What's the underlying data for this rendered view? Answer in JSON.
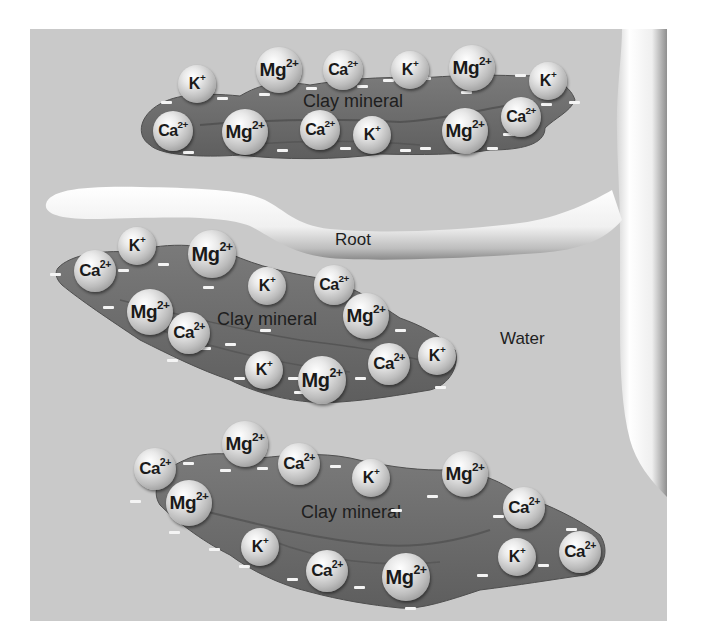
{
  "figure": {
    "labels": {
      "root": "Root",
      "water": "Water",
      "clay_mineral": "Clay mineral"
    },
    "colors": {
      "background": "#c9c9c9",
      "clay": "#6e6e6e",
      "clay_edge": "#4a4a4a",
      "root": "#f2f2f2",
      "negative_charge": "#f4f4f4"
    },
    "clusters": [
      {
        "label": "Clay mineral",
        "ions": [
          {
            "symbol": "K",
            "charge": "+",
            "x": 197,
            "y": 84,
            "r": 19
          },
          {
            "symbol": "Mg",
            "charge": "2+",
            "x": 279,
            "y": 70,
            "r": 23
          },
          {
            "symbol": "Ca",
            "charge": "2+",
            "x": 343,
            "y": 70,
            "r": 20
          },
          {
            "symbol": "K",
            "charge": "+",
            "x": 410,
            "y": 70,
            "r": 19
          },
          {
            "symbol": "Mg",
            "charge": "2+",
            "x": 472,
            "y": 68,
            "r": 23
          },
          {
            "symbol": "K",
            "charge": "+",
            "x": 548,
            "y": 81,
            "r": 19
          },
          {
            "symbol": "Ca",
            "charge": "2+",
            "x": 173,
            "y": 131,
            "r": 20
          },
          {
            "symbol": "Mg",
            "charge": "2+",
            "x": 245,
            "y": 132,
            "r": 23
          },
          {
            "symbol": "Ca",
            "charge": "2+",
            "x": 320,
            "y": 130,
            "r": 20
          },
          {
            "symbol": "K",
            "charge": "+",
            "x": 372,
            "y": 135,
            "r": 19
          },
          {
            "symbol": "Mg",
            "charge": "2+",
            "x": 465,
            "y": 131,
            "r": 23
          },
          {
            "symbol": "Ca",
            "charge": "2+",
            "x": 521,
            "y": 117,
            "r": 20
          }
        ]
      },
      {
        "label": "Clay mineral",
        "ions": [
          {
            "symbol": "K",
            "charge": "+",
            "x": 137,
            "y": 246,
            "r": 19
          },
          {
            "symbol": "Ca",
            "charge": "2+",
            "x": 95,
            "y": 271,
            "r": 21
          },
          {
            "symbol": "Mg",
            "charge": "2+",
            "x": 212,
            "y": 254,
            "r": 24
          },
          {
            "symbol": "K",
            "charge": "+",
            "x": 267,
            "y": 286,
            "r": 19
          },
          {
            "symbol": "Ca",
            "charge": "2+",
            "x": 334,
            "y": 285,
            "r": 20
          },
          {
            "symbol": "Mg",
            "charge": "2+",
            "x": 366,
            "y": 316,
            "r": 23
          },
          {
            "symbol": "Mg",
            "charge": "2+",
            "x": 150,
            "y": 312,
            "r": 23
          },
          {
            "symbol": "Ca",
            "charge": "2+",
            "x": 189,
            "y": 333,
            "r": 21
          },
          {
            "symbol": "K",
            "charge": "+",
            "x": 264,
            "y": 370,
            "r": 19
          },
          {
            "symbol": "Mg",
            "charge": "2+",
            "x": 322,
            "y": 380,
            "r": 24
          },
          {
            "symbol": "Ca",
            "charge": "2+",
            "x": 389,
            "y": 364,
            "r": 21
          },
          {
            "symbol": "K",
            "charge": "+",
            "x": 437,
            "y": 356,
            "r": 19
          }
        ]
      },
      {
        "label": "Clay mineral",
        "ions": [
          {
            "symbol": "Mg",
            "charge": "2+",
            "x": 245,
            "y": 444,
            "r": 23
          },
          {
            "symbol": "Ca",
            "charge": "2+",
            "x": 155,
            "y": 469,
            "r": 21
          },
          {
            "symbol": "Ca",
            "charge": "2+",
            "x": 299,
            "y": 464,
            "r": 21
          },
          {
            "symbol": "K",
            "charge": "+",
            "x": 371,
            "y": 478,
            "r": 19
          },
          {
            "symbol": "Mg",
            "charge": "2+",
            "x": 465,
            "y": 474,
            "r": 23
          },
          {
            "symbol": "Ca",
            "charge": "2+",
            "x": 524,
            "y": 508,
            "r": 21
          },
          {
            "symbol": "Mg",
            "charge": "2+",
            "x": 189,
            "y": 503,
            "r": 23
          },
          {
            "symbol": "K",
            "charge": "+",
            "x": 260,
            "y": 547,
            "r": 19
          },
          {
            "symbol": "Ca",
            "charge": "2+",
            "x": 327,
            "y": 571,
            "r": 21
          },
          {
            "symbol": "Mg",
            "charge": "2+",
            "x": 406,
            "y": 577,
            "r": 24
          },
          {
            "symbol": "K",
            "charge": "+",
            "x": 517,
            "y": 557,
            "r": 19
          },
          {
            "symbol": "Ca",
            "charge": "2+",
            "x": 580,
            "y": 552,
            "r": 21
          }
        ]
      }
    ],
    "negative_charges": [
      [
        166,
        102
      ],
      [
        222,
        98
      ],
      [
        264,
        94
      ],
      [
        311,
        88
      ],
      [
        362,
        86
      ],
      [
        388,
        80
      ],
      [
        425,
        78
      ],
      [
        466,
        92
      ],
      [
        486,
        78
      ],
      [
        520,
        75
      ],
      [
        546,
        104
      ],
      [
        574,
        102
      ],
      [
        188,
        152
      ],
      [
        282,
        150
      ],
      [
        345,
        148
      ],
      [
        405,
        150
      ],
      [
        425,
        148
      ],
      [
        492,
        148
      ],
      [
        508,
        134
      ],
      [
        55,
        274
      ],
      [
        123,
        270
      ],
      [
        163,
        264
      ],
      [
        108,
        307
      ],
      [
        144,
        294
      ],
      [
        208,
        287
      ],
      [
        205,
        348
      ],
      [
        230,
        344
      ],
      [
        172,
        360
      ],
      [
        265,
        330
      ],
      [
        239,
        378
      ],
      [
        293,
        378
      ],
      [
        299,
        392
      ],
      [
        360,
        378
      ],
      [
        440,
        387
      ],
      [
        400,
        330
      ],
      [
        135,
        501
      ],
      [
        188,
        463
      ],
      [
        225,
        470
      ],
      [
        262,
        468
      ],
      [
        305,
        471
      ],
      [
        335,
        466
      ],
      [
        396,
        510
      ],
      [
        432,
        496
      ],
      [
        498,
        516
      ],
      [
        571,
        529
      ],
      [
        174,
        532
      ],
      [
        214,
        549
      ],
      [
        244,
        566
      ],
      [
        292,
        579
      ],
      [
        359,
        587
      ],
      [
        410,
        608
      ],
      [
        482,
        575
      ],
      [
        543,
        565
      ]
    ]
  }
}
